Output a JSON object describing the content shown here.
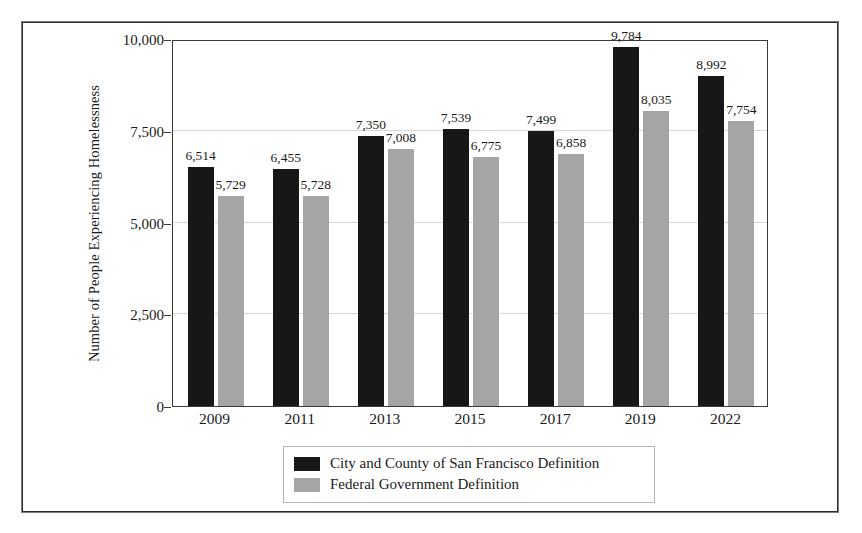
{
  "chart_data": {
    "type": "bar",
    "title": "",
    "xlabel": "",
    "ylabel": "Number of People Experiencing Homelessness",
    "categories": [
      "2009",
      "2011",
      "2013",
      "2015",
      "2017",
      "2019",
      "2022"
    ],
    "series": [
      {
        "name": "City and County of San Francisco Definition",
        "color": "#171717",
        "values": [
          6514,
          6455,
          7350,
          7539,
          7499,
          9784,
          8992
        ],
        "labels": [
          "6,514",
          "6,455",
          "7,350",
          "7,539",
          "7,499",
          "9,784",
          "8,992"
        ]
      },
      {
        "name": "Federal Government Definition",
        "color": "#a5a5a5",
        "values": [
          5729,
          5728,
          7008,
          6775,
          6858,
          8035,
          7754
        ],
        "labels": [
          "5,729",
          "5,728",
          "7,008",
          "6,775",
          "6,858",
          "8,035",
          "7,754"
        ]
      }
    ],
    "ylim": [
      0,
      10000
    ],
    "yticks": [
      0,
      2500,
      5000,
      7500,
      10000
    ],
    "ytick_labels": [
      "0",
      "2,500",
      "5,000",
      "7,500",
      "10,000"
    ],
    "grid": true,
    "legend_position": "below-center"
  },
  "legend": {
    "entries": [
      {
        "label": "City and County of San Francisco Definition",
        "swatch": "dark"
      },
      {
        "label": "Federal Government Definition",
        "swatch": "light"
      }
    ]
  }
}
